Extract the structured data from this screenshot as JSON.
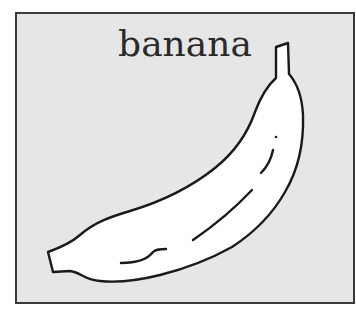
{
  "card": {
    "title": "banana",
    "image": {
      "subject": "banana-icon",
      "fill": "#ffffff",
      "stroke": "#1a1a1a",
      "background": "#e6e6e6"
    }
  }
}
